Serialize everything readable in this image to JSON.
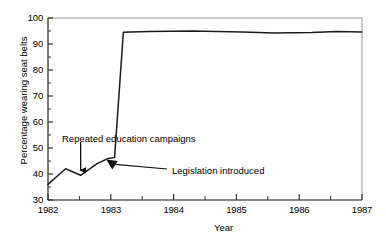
{
  "chart_data": {
    "type": "line",
    "title": "",
    "xlabel": "Year",
    "ylabel": "Percentage wearing seat belts",
    "xlim": [
      1982,
      1987
    ],
    "ylim": [
      30,
      100
    ],
    "grid": false,
    "legend": "none",
    "x_ticks": [
      "1982",
      "1983",
      "1984",
      "1985",
      "1986",
      "1987"
    ],
    "x_tick_values": [
      1982,
      1983,
      1984,
      1985,
      1986,
      1987
    ],
    "x_minor_ticks": [
      1982.5,
      1983.5,
      1984.5,
      1985.5,
      1986.5
    ],
    "y_ticks": [
      "30",
      "40",
      "50",
      "60",
      "70",
      "80",
      "90",
      "100"
    ],
    "y_tick_values": [
      30,
      40,
      50,
      60,
      70,
      80,
      90,
      100
    ],
    "y_minor_ticks": [
      35,
      45,
      55,
      65,
      75,
      85,
      95
    ],
    "series": [
      {
        "name": "Percentage wearing seat belts",
        "x": [
          1982.0,
          1982.28,
          1982.52,
          1982.78,
          1982.96,
          1983.06,
          1983.2,
          1983.6,
          1984.3,
          1985.1,
          1985.6,
          1986.2,
          1986.6,
          1987.0
        ],
        "values": [
          36.0,
          42.0,
          39.5,
          44.0,
          46.0,
          46.3,
          94.5,
          94.8,
          95.0,
          94.6,
          94.2,
          94.4,
          94.8,
          94.6
        ]
      }
    ],
    "annotations": [
      {
        "label": "Repeated education campaigns",
        "text_x": 62,
        "text_y": 133,
        "arrow": "down",
        "points_to_x": 1982.52,
        "points_to_y": 39.5
      },
      {
        "label": "Legislation introduced",
        "text_x": 172,
        "text_y": 165,
        "arrow": "leader-diagonal",
        "points_to_x": 1982.96,
        "points_to_y": 46.0
      }
    ],
    "colors": {
      "line": "#1a1a1a",
      "axis": "#555555",
      "frame": "#9a9a9a",
      "text": "#000000",
      "background": "#ffffff"
    }
  }
}
